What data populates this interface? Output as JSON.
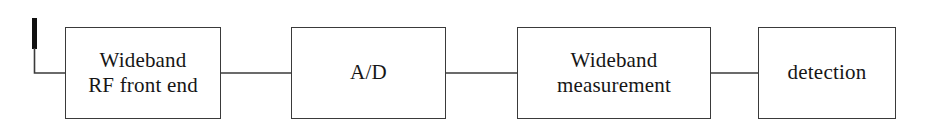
{
  "diagram": {
    "type": "block-diagram",
    "background_color": "#ffffff",
    "line_color": "#3a3a3a",
    "text_color": "#161616",
    "antenna": {
      "icon": "antenna-icon",
      "element_color": "#111111"
    },
    "blocks": [
      {
        "id": "rf-front-end",
        "lines": [
          "Wideband",
          "RF front end"
        ],
        "line1": "Wideband",
        "line2": "RF front end"
      },
      {
        "id": "ad",
        "lines": [
          "A/D"
        ],
        "line1": "A/D",
        "line2": ""
      },
      {
        "id": "wideband-measurement",
        "lines": [
          "Wideband",
          "measurement"
        ],
        "line1": "Wideband",
        "line2": "measurement"
      },
      {
        "id": "detection",
        "lines": [
          "detection"
        ],
        "line1": "detection",
        "line2": ""
      }
    ],
    "connectors": [
      {
        "id": "antenna-to-rf-front-end",
        "from": "antenna",
        "to": "rf-front-end"
      },
      {
        "id": "rf-front-end-to-ad",
        "from": "rf-front-end",
        "to": "ad"
      },
      {
        "id": "ad-to-wideband-measurement",
        "from": "ad",
        "to": "wideband-measurement"
      },
      {
        "id": "wideband-measurement-to-detection",
        "from": "wideband-measurement",
        "to": "detection"
      }
    ]
  }
}
